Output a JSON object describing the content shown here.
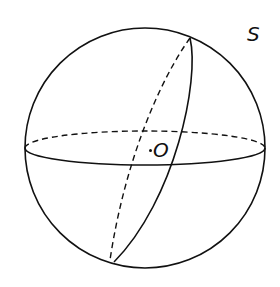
{
  "diagram": {
    "type": "sphere-with-great-circles",
    "labels": {
      "sphere": "S",
      "center": "O"
    },
    "colors": {
      "stroke": "#111111",
      "background": "#ffffff"
    },
    "elements": [
      {
        "name": "sphere-outline",
        "style": "solid"
      },
      {
        "name": "equator-front",
        "style": "solid"
      },
      {
        "name": "equator-back",
        "style": "dashed"
      },
      {
        "name": "tilted-great-circle-front",
        "style": "solid"
      },
      {
        "name": "tilted-great-circle-back",
        "style": "dashed"
      },
      {
        "name": "center-point",
        "style": "dot"
      }
    ]
  }
}
